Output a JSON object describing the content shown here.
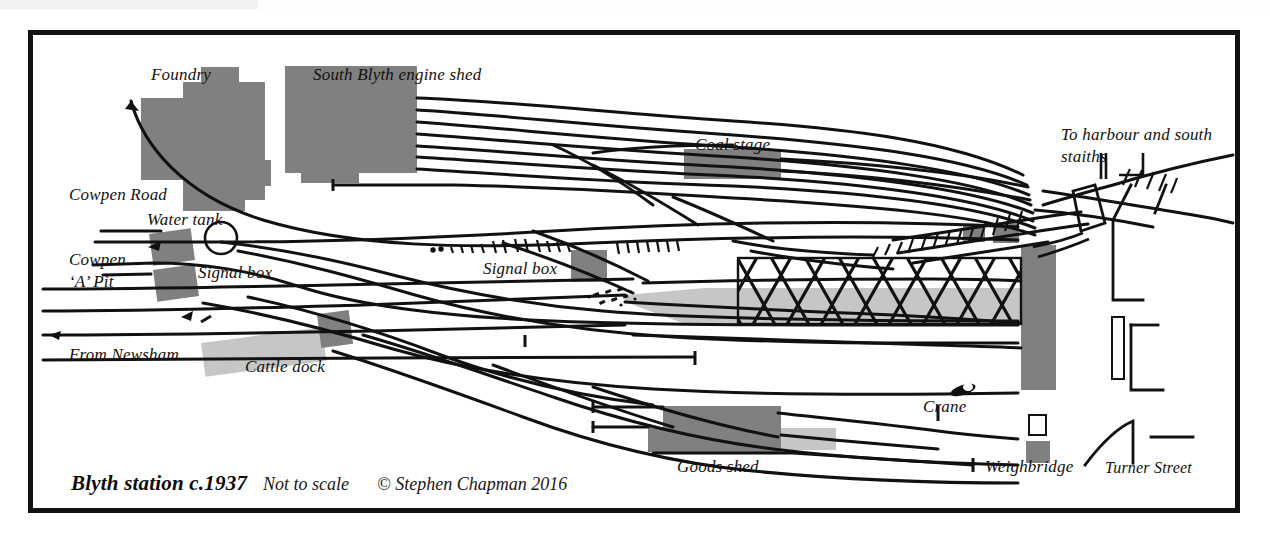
{
  "diagram": {
    "kind": "railway-track-plan",
    "frame_color": "#121212",
    "background_color": "#ffffff",
    "building_fill_dark": "#808080",
    "building_fill_light": "#c6c6c6",
    "track_color": "#111111"
  },
  "caption": {
    "title": "Blyth station c.1937",
    "scale_note": "Not to scale",
    "copyright": "© Stephen Chapman 2016"
  },
  "labels": [
    {
      "id": "foundry",
      "text": "Foundry",
      "x": 118,
      "y": 40,
      "size": 17
    },
    {
      "id": "engine-shed",
      "text": "South Blyth engine shed",
      "x": 280,
      "y": 40,
      "size": 17
    },
    {
      "id": "coal-stage",
      "text": "Coal stage",
      "x": 662,
      "y": 118,
      "size": 17
    },
    {
      "id": "to-harbour",
      "text": "To harbour and south",
      "x": 1028,
      "y": 105,
      "size": 17
    },
    {
      "id": "to-harbour-2",
      "text": "staiths",
      "x": 1028,
      "y": 128,
      "size": 17
    },
    {
      "id": "cowpen-road",
      "text": "Cowpen Road",
      "x": 64,
      "y": 162,
      "size": 17
    },
    {
      "id": "water-tank",
      "text": "Water tank",
      "x": 142,
      "y": 203,
      "size": 17
    },
    {
      "id": "cowpen-a-pit",
      "text": "Cowpen",
      "x": 64,
      "y": 243,
      "size": 17
    },
    {
      "id": "cowpen-a-pit-2",
      "text": "‘A’ Pit",
      "x": 64,
      "y": 266,
      "size": 17
    },
    {
      "id": "signal-box-west",
      "text": "Signal box",
      "x": 193,
      "y": 255,
      "size": 17
    },
    {
      "id": "signal-box-mid",
      "text": "Signal box",
      "x": 478,
      "y": 251,
      "size": 17
    },
    {
      "id": "from-newsham",
      "text": "From Newsham",
      "x": 64,
      "y": 338,
      "size": 17
    },
    {
      "id": "cattle-dock",
      "text": "Cattle dock",
      "x": 240,
      "y": 348,
      "size": 17
    },
    {
      "id": "crane",
      "text": "Crane",
      "x": 918,
      "y": 389,
      "size": 17
    },
    {
      "id": "goods-shed",
      "text": "Goods shed",
      "x": 672,
      "y": 450,
      "size": 17
    },
    {
      "id": "weighbridge",
      "text": "Weighbridge",
      "x": 980,
      "y": 450,
      "size": 17
    },
    {
      "id": "turner-street",
      "text": "Turner Street",
      "x": 1100,
      "y": 452,
      "size": 16
    }
  ],
  "features": {
    "buildings": [
      {
        "name": "foundry-block",
        "shade": "dark"
      },
      {
        "name": "foundry-outbuilding",
        "shade": "dark"
      },
      {
        "name": "engine-shed-block",
        "shade": "dark"
      },
      {
        "name": "coal-stage-block",
        "shade": "dark"
      },
      {
        "name": "water-tank-block",
        "shade": "dark"
      },
      {
        "name": "signal-box-west-block",
        "shade": "dark"
      },
      {
        "name": "signal-box-mid-block",
        "shade": "dark"
      },
      {
        "name": "cattle-dock-platform",
        "shade": "light"
      },
      {
        "name": "cattle-dock-endblock",
        "shade": "dark"
      },
      {
        "name": "goods-shed-block",
        "shade": "dark"
      },
      {
        "name": "goods-shed-annex",
        "shade": "light"
      },
      {
        "name": "station-building",
        "shade": "dark"
      },
      {
        "name": "weighbridge-block",
        "shade": "dark"
      },
      {
        "name": "yard-hut-a",
        "shade": "dark"
      },
      {
        "name": "yard-hut-b",
        "shade": "dark"
      },
      {
        "name": "platform-strip",
        "shade": "light"
      }
    ],
    "symbols": [
      {
        "name": "water-tank-circle",
        "kind": "circle"
      },
      {
        "name": "crane-symbol",
        "kind": "crane"
      },
      {
        "name": "weighbridge-outline",
        "kind": "square-outline"
      },
      {
        "name": "station-canopy",
        "kind": "cross-hatch"
      }
    ]
  }
}
